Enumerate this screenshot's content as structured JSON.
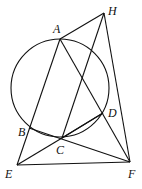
{
  "diagram": {
    "type": "geometry",
    "points": {
      "A": {
        "label": "A",
        "x": 60,
        "y": 39
      },
      "B": {
        "label": "B",
        "x": 29,
        "y": 128
      },
      "C": {
        "label": "C",
        "x": 62,
        "y": 138
      },
      "D": {
        "label": "D",
        "x": 103,
        "y": 113
      },
      "E": {
        "label": "E",
        "x": 17,
        "y": 165
      },
      "F": {
        "label": "F",
        "x": 130,
        "y": 162
      },
      "H": {
        "label": "H",
        "x": 104,
        "y": 13
      }
    },
    "circle": {
      "cx": 60,
      "cy": 88,
      "r": 49
    },
    "segments": [
      "AH",
      "HF",
      "HC",
      "AE",
      "AF",
      "BF",
      "EF",
      "EC",
      "CD",
      "BC"
    ]
  }
}
